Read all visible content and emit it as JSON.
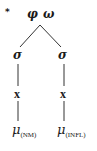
{
  "diagram": {
    "marker": "*",
    "root": {
      "labels": [
        "φ",
        "ω"
      ]
    },
    "branches": [
      {
        "syllable": "σ",
        "skeletal": "x",
        "mora": "μ",
        "mora_subscript": "(NM)"
      },
      {
        "syllable": "σ",
        "skeletal": "x",
        "mora": "μ",
        "mora_subscript": "(INFL)"
      }
    ]
  }
}
